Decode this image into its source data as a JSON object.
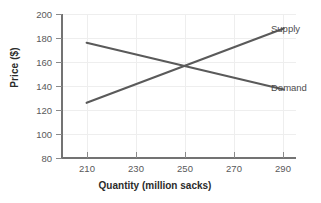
{
  "chart_data": {
    "type": "line",
    "title": "",
    "xlabel": "Quantity (million sacks)",
    "ylabel": "Price ($)",
    "xlim": [
      200,
      295
    ],
    "ylim": [
      80,
      200
    ],
    "xticks": [
      210,
      230,
      250,
      270,
      290
    ],
    "yticks": [
      80,
      100,
      120,
      140,
      160,
      180,
      200
    ],
    "xtick_labels": [
      "210",
      "230",
      "250",
      "270",
      "290"
    ],
    "ytick_labels": [
      "80",
      "100",
      "120",
      "140",
      "160",
      "180",
      "200"
    ],
    "grid": true,
    "legend_position": "right-inline-labels",
    "line_color": "#5a5a5a",
    "axis_color": "#737373",
    "grid_color": "#eeeeee",
    "series": [
      {
        "name": "Supply",
        "x": [
          210,
          290
        ],
        "values": [
          126,
          188
        ]
      },
      {
        "name": "Demand",
        "x": [
          210,
          290
        ],
        "values": [
          176,
          137
        ]
      }
    ],
    "equilibrium": {
      "quantity": 250,
      "price": 156
    }
  }
}
